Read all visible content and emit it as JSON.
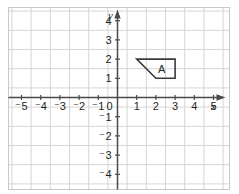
{
  "figure": {
    "kind": "coordinate-grid",
    "background_color": "#ffffff",
    "grid_color": "#d6d6d6",
    "border_color": "#c8c8c8",
    "axis_color": "#4a4a4a",
    "label_color": "#231f20",
    "shape_color": "#3a3a3a"
  },
  "chart_data": {
    "type": "scatter",
    "title": "",
    "xlabel": "x",
    "ylabel": "y",
    "xlim": [
      -5.5,
      5.5
    ],
    "ylim": [
      -4.5,
      4.5
    ],
    "grid": true,
    "legend": false,
    "x_ticks": [
      -5,
      -4,
      -3,
      -2,
      -1,
      0,
      1,
      2,
      3,
      4,
      5
    ],
    "y_ticks": [
      4,
      3,
      2,
      1,
      0,
      -1,
      -2,
      -3,
      -4
    ],
    "x_tick_labels": [
      "⁻5",
      "⁻4",
      "⁻3",
      "⁻2",
      "⁻1",
      "0",
      "1",
      "2",
      "3",
      "4",
      "5"
    ],
    "y_tick_labels": [
      "4",
      "3",
      "2",
      "1",
      "0",
      "⁻1",
      "⁻2",
      "⁻3",
      "⁻4"
    ],
    "shapes": [
      {
        "label": "A",
        "type": "polygon",
        "vertices": [
          [
            1,
            2
          ],
          [
            3,
            2
          ],
          [
            3,
            1
          ],
          [
            2,
            1
          ]
        ],
        "label_position": [
          2.3,
          1.5
        ],
        "filled": false
      }
    ]
  },
  "axes": {
    "x_axis_label": "x",
    "y_axis_label": "y",
    "origin_label": "0"
  }
}
